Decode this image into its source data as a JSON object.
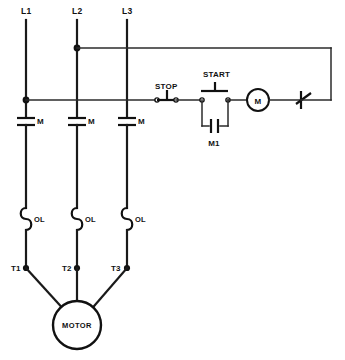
{
  "diagram": {
    "type": "electrical-ladder-schematic",
    "line_color": "#111111",
    "background_color": "#ffffff"
  },
  "power_lines": [
    {
      "id": "L1",
      "label": "L1"
    },
    {
      "id": "L2",
      "label": "L2"
    },
    {
      "id": "L3",
      "label": "L3"
    }
  ],
  "contactor_contacts": [
    {
      "id": "M-L1",
      "label": "M"
    },
    {
      "id": "M-L2",
      "label": "M"
    },
    {
      "id": "M-L3",
      "label": "M"
    }
  ],
  "overload_heaters": [
    {
      "id": "OL-L1",
      "label": "OL"
    },
    {
      "id": "OL-L2",
      "label": "OL"
    },
    {
      "id": "OL-L3",
      "label": "OL"
    }
  ],
  "motor_terminals": [
    {
      "id": "T1",
      "label": "T1"
    },
    {
      "id": "T2",
      "label": "T2"
    },
    {
      "id": "T3",
      "label": "T3"
    }
  ],
  "motor": {
    "label": "MOTOR"
  },
  "control_circuit": {
    "stop_button": {
      "label": "STOP",
      "type": "normally-closed-pushbutton"
    },
    "start_button": {
      "label": "START",
      "type": "normally-open-pushbutton"
    },
    "holding_contact": {
      "label": "M1",
      "type": "normally-open-auxiliary-contact"
    },
    "coil": {
      "label": "M",
      "type": "contactor-coil"
    },
    "overload_contact": {
      "label": "",
      "type": "normally-closed-overload-contact"
    }
  }
}
